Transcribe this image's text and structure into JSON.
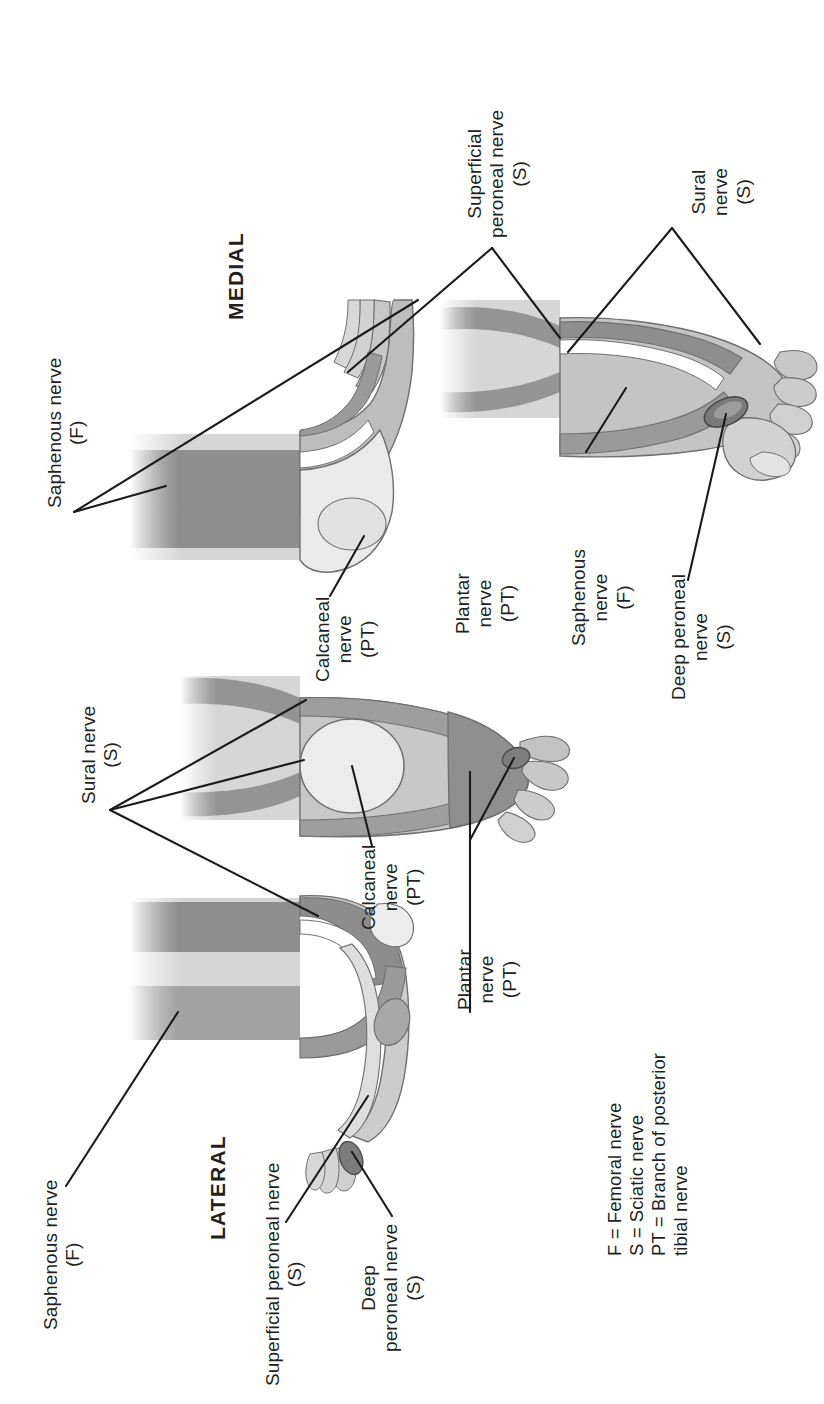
{
  "figure": {
    "orientation_note": "all text rotated 90 degrees counter-clockwise"
  },
  "section_headings": {
    "medial": "MEDIAL",
    "lateral": "LATERAL"
  },
  "labels": {
    "saphenous_top": "Saphenous nerve\n(F)",
    "saphenous_bottom": "Saphenous nerve\n(F)",
    "saphenous_right": "Saphenous\nnerve\n(F)",
    "sural_left": "Sural nerve\n(S)",
    "sural_right": "Sural\nnerve\n(S)",
    "superficial_peroneal_top": "Superficial\nperoneal nerve\n(S)",
    "superficial_peroneal_bottom": "Superficial peroneal nerve\n(S)",
    "deep_peroneal_bottom": "Deep\nperoneal nerve\n(S)",
    "deep_peroneal_right": "Deep peroneal\nnerve\n(S)",
    "calcaneal_upper": "Calcaneal\nnerve\n(PT)",
    "calcaneal_lower": "Calcaneal\nnerve\n(PT)",
    "plantar_upper": "Plantar\nnerve\n(PT)",
    "plantar_lower": "Plantar\nnerve\n(PT)"
  },
  "legend": {
    "line1": "F = Femoral nerve",
    "line2": "S = Sciatic nerve",
    "line3": "PT = Branch of posterior",
    "line4": "tibial nerve",
    "abbreviations": [
      {
        "key": "F",
        "meaning": "Femoral nerve"
      },
      {
        "key": "S",
        "meaning": "Sciatic nerve"
      },
      {
        "key": "PT",
        "meaning": "Branch of posterior tibial nerve"
      }
    ]
  },
  "views": [
    {
      "name": "medial-foot-view",
      "heading": "MEDIAL"
    },
    {
      "name": "plantar-foot-view",
      "heading": ""
    },
    {
      "name": "lateral-foot-view",
      "heading": "LATERAL"
    },
    {
      "name": "dorsal-foot-view",
      "heading": ""
    }
  ],
  "colors": {
    "ink": "#231f20",
    "leader_line": "#1a1a1a",
    "shade_dark": "#8e8e8e",
    "shade_mid": "#a9a9a9",
    "shade_light": "#c3c3c3",
    "shade_pale": "#d8d8d8",
    "shade_lightest": "#e9e9e9",
    "outline": "#6f6f6f",
    "background": "#ffffff"
  }
}
